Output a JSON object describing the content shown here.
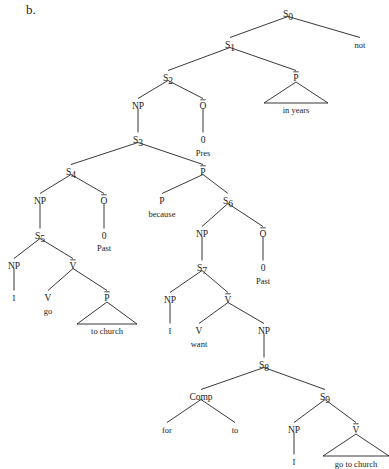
{
  "figure": {
    "label": "b.",
    "type": "syntactic-tree-diagram",
    "width": 389,
    "height": 469,
    "line_color": "#222222",
    "text_color": "#1a1a1a",
    "background": "#ffffff"
  },
  "nodes": [
    {
      "id": "S0",
      "label": "S",
      "sub": "0",
      "bar": false,
      "x": 288,
      "y": 14
    },
    {
      "id": "not",
      "label": "not",
      "sub": "",
      "bar": false,
      "x": 360,
      "y": 45,
      "leaf": true
    },
    {
      "id": "S1",
      "label": "S",
      "sub": "1",
      "bar": false,
      "x": 230,
      "y": 45
    },
    {
      "id": "S2",
      "label": "S",
      "sub": "2",
      "bar": false,
      "x": 168,
      "y": 78
    },
    {
      "id": "Pbar_yr",
      "label": "P",
      "sub": "",
      "bar": true,
      "x": 296,
      "y": 78
    },
    {
      "id": "in_years",
      "label": "in years",
      "sub": "",
      "bar": false,
      "x": 296,
      "y": 110,
      "leaf": true
    },
    {
      "id": "NP2",
      "label": "NP",
      "sub": "",
      "bar": false,
      "x": 138,
      "y": 106
    },
    {
      "id": "O2",
      "label": "O",
      "sub": "",
      "bar": true,
      "x": 203,
      "y": 106
    },
    {
      "id": "zero2",
      "label": "0",
      "sub": "",
      "bar": false,
      "x": 203,
      "y": 140
    },
    {
      "id": "Pres",
      "label": "Pres",
      "sub": "",
      "bar": false,
      "x": 203,
      "y": 153,
      "leaf": true
    },
    {
      "id": "S3",
      "label": "S",
      "sub": "3",
      "bar": false,
      "x": 138,
      "y": 140
    },
    {
      "id": "S4",
      "label": "S",
      "sub": "4",
      "bar": false,
      "x": 71,
      "y": 172
    },
    {
      "id": "Pbar_bc",
      "label": "P",
      "sub": "",
      "bar": true,
      "x": 203,
      "y": 172
    },
    {
      "id": "NP4",
      "label": "NP",
      "sub": "",
      "bar": false,
      "x": 40,
      "y": 201
    },
    {
      "id": "O4",
      "label": "O",
      "sub": "",
      "bar": true,
      "x": 104,
      "y": 201
    },
    {
      "id": "zero4",
      "label": "0",
      "sub": "",
      "bar": false,
      "x": 104,
      "y": 236
    },
    {
      "id": "Past4",
      "label": "Past",
      "sub": "",
      "bar": false,
      "x": 104,
      "y": 248,
      "leaf": true
    },
    {
      "id": "P_bec",
      "label": "P",
      "sub": "",
      "bar": false,
      "x": 162,
      "y": 201
    },
    {
      "id": "because",
      "label": "because",
      "sub": "",
      "bar": false,
      "x": 162,
      "y": 214,
      "leaf": true
    },
    {
      "id": "S6",
      "label": "S",
      "sub": "6",
      "bar": false,
      "x": 228,
      "y": 201
    },
    {
      "id": "S5",
      "label": "S",
      "sub": "5",
      "bar": false,
      "x": 40,
      "y": 236
    },
    {
      "id": "NP5",
      "label": "NP",
      "sub": "",
      "bar": false,
      "x": 14,
      "y": 266
    },
    {
      "id": "Vbar5",
      "label": "V",
      "sub": "",
      "bar": true,
      "x": 73,
      "y": 266
    },
    {
      "id": "I5",
      "label": "I",
      "sub": "",
      "bar": false,
      "x": 14,
      "y": 298,
      "leaf": true
    },
    {
      "id": "V_go",
      "label": "V",
      "sub": "",
      "bar": false,
      "x": 48,
      "y": 298
    },
    {
      "id": "go",
      "label": "go",
      "sub": "",
      "bar": false,
      "x": 48,
      "y": 311,
      "leaf": true
    },
    {
      "id": "Pbar_ch",
      "label": "P",
      "sub": "",
      "bar": true,
      "x": 107,
      "y": 298
    },
    {
      "id": "to_church",
      "label": "to church",
      "sub": "",
      "bar": false,
      "x": 107,
      "y": 331,
      "leaf": true
    },
    {
      "id": "NP6",
      "label": "NP",
      "sub": "",
      "bar": false,
      "x": 202,
      "y": 234
    },
    {
      "id": "O6",
      "label": "O",
      "sub": "",
      "bar": true,
      "x": 263,
      "y": 234
    },
    {
      "id": "zero6",
      "label": "0",
      "sub": "",
      "bar": false,
      "x": 263,
      "y": 268
    },
    {
      "id": "Past6",
      "label": "Past",
      "sub": "",
      "bar": false,
      "x": 263,
      "y": 281,
      "leaf": true
    },
    {
      "id": "S7",
      "label": "S",
      "sub": "7",
      "bar": false,
      "x": 202,
      "y": 268
    },
    {
      "id": "NP7",
      "label": "NP",
      "sub": "",
      "bar": false,
      "x": 170,
      "y": 300
    },
    {
      "id": "Vbar7",
      "label": "V",
      "sub": "",
      "bar": true,
      "x": 228,
      "y": 300
    },
    {
      "id": "I7",
      "label": "I",
      "sub": "",
      "bar": false,
      "x": 170,
      "y": 331,
      "leaf": true
    },
    {
      "id": "V_want",
      "label": "V",
      "sub": "",
      "bar": false,
      "x": 199,
      "y": 331
    },
    {
      "id": "want",
      "label": "want",
      "sub": "",
      "bar": false,
      "x": 199,
      "y": 344,
      "leaf": true
    },
    {
      "id": "NP8",
      "label": "NP",
      "sub": "",
      "bar": false,
      "x": 264,
      "y": 331
    },
    {
      "id": "S8",
      "label": "S",
      "sub": "8",
      "bar": false,
      "x": 264,
      "y": 365
    },
    {
      "id": "Comp",
      "label": "Comp",
      "sub": "",
      "bar": false,
      "x": 201,
      "y": 397
    },
    {
      "id": "S9",
      "label": "S",
      "sub": "9",
      "bar": false,
      "x": 325,
      "y": 397
    },
    {
      "id": "for",
      "label": "for",
      "sub": "",
      "bar": false,
      "x": 167,
      "y": 430,
      "leaf": true
    },
    {
      "id": "to",
      "label": "to",
      "sub": "",
      "bar": false,
      "x": 235,
      "y": 430,
      "leaf": true
    },
    {
      "id": "NP9",
      "label": "NP",
      "sub": "",
      "bar": false,
      "x": 294,
      "y": 430
    },
    {
      "id": "Vbar9",
      "label": "V",
      "sub": "",
      "bar": true,
      "x": 356,
      "y": 430
    },
    {
      "id": "I9",
      "label": "I",
      "sub": "",
      "bar": false,
      "x": 294,
      "y": 462,
      "leaf": true
    },
    {
      "id": "go_to_church",
      "label": "go to church",
      "sub": "",
      "bar": false,
      "x": 356,
      "y": 464,
      "leaf": true
    }
  ],
  "edges": [
    {
      "from": "S0",
      "to": "S1"
    },
    {
      "from": "S0",
      "to": "not"
    },
    {
      "from": "S1",
      "to": "S2"
    },
    {
      "from": "S1",
      "to": "Pbar_yr"
    },
    {
      "from": "S2",
      "to": "NP2"
    },
    {
      "from": "S2",
      "to": "O2"
    },
    {
      "from": "NP2",
      "to": "S3"
    },
    {
      "from": "O2",
      "to": "zero2"
    },
    {
      "from": "S3",
      "to": "S4"
    },
    {
      "from": "S3",
      "to": "Pbar_bc"
    },
    {
      "from": "S4",
      "to": "NP4"
    },
    {
      "from": "S4",
      "to": "O4"
    },
    {
      "from": "O4",
      "to": "zero4"
    },
    {
      "from": "NP4",
      "to": "S5"
    },
    {
      "from": "Pbar_bc",
      "to": "P_bec"
    },
    {
      "from": "Pbar_bc",
      "to": "S6"
    },
    {
      "from": "S5",
      "to": "NP5"
    },
    {
      "from": "S5",
      "to": "Vbar5"
    },
    {
      "from": "NP5",
      "to": "I5"
    },
    {
      "from": "Vbar5",
      "to": "V_go"
    },
    {
      "from": "Vbar5",
      "to": "Pbar_ch"
    },
    {
      "from": "S6",
      "to": "NP6"
    },
    {
      "from": "S6",
      "to": "O6"
    },
    {
      "from": "O6",
      "to": "zero6"
    },
    {
      "from": "NP6",
      "to": "S7"
    },
    {
      "from": "S7",
      "to": "NP7"
    },
    {
      "from": "S7",
      "to": "Vbar7"
    },
    {
      "from": "NP7",
      "to": "I7"
    },
    {
      "from": "Vbar7",
      "to": "V_want"
    },
    {
      "from": "Vbar7",
      "to": "NP8"
    },
    {
      "from": "NP8",
      "to": "S8"
    },
    {
      "from": "S8",
      "to": "Comp"
    },
    {
      "from": "S8",
      "to": "S9"
    },
    {
      "from": "Comp",
      "to": "for"
    },
    {
      "from": "Comp",
      "to": "to"
    },
    {
      "from": "S9",
      "to": "NP9"
    },
    {
      "from": "S9",
      "to": "Vbar9"
    },
    {
      "from": "NP9",
      "to": "I9"
    }
  ],
  "triangles": [
    {
      "node": "Pbar_yr",
      "text": "in years",
      "cx": 296,
      "apex_y": 82,
      "base_y": 103,
      "half_width": 32
    },
    {
      "node": "Pbar_ch",
      "text": "to church",
      "cx": 107,
      "apex_y": 302,
      "base_y": 324,
      "half_width": 30
    },
    {
      "node": "Vbar9",
      "text": "go to church",
      "cx": 356,
      "apex_y": 434,
      "base_y": 456,
      "half_width": 33
    }
  ]
}
